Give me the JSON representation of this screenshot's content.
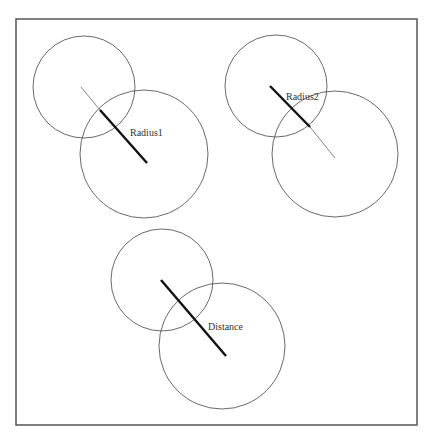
{
  "diagram": {
    "title": "",
    "colors": {
      "frame": "#555555",
      "circle": "#444444",
      "thin_line": "#666666",
      "thick_line": "#111111",
      "text": "#333333",
      "background": "#ffffff"
    },
    "frame": {
      "x": 16,
      "y": 19,
      "width": 401,
      "height": 406
    },
    "panels": [
      {
        "id": "radius1",
        "label": "Radius1",
        "label_pos": {
          "x": 130,
          "y": 136
        },
        "small_circle": {
          "cx": 84,
          "cy": 87,
          "r": 51
        },
        "large_circle": {
          "cx": 144,
          "cy": 154,
          "r": 64
        },
        "thin_segment": {
          "x1": 81,
          "y1": 87,
          "x2": 100,
          "y2": 110
        },
        "thick_segment": {
          "x1": 100,
          "y1": 110,
          "x2": 147,
          "y2": 163
        }
      },
      {
        "id": "radius2",
        "label": "Radius2",
        "label_pos": {
          "x": 286,
          "y": 100
        },
        "small_circle": {
          "cx": 276,
          "cy": 86,
          "r": 51
        },
        "large_circle": {
          "cx": 335,
          "cy": 154,
          "r": 63
        },
        "thick_segment": {
          "x1": 270,
          "y1": 86,
          "x2": 310,
          "y2": 127
        },
        "thin_segment": {
          "x1": 310,
          "y1": 127,
          "x2": 335,
          "y2": 158
        }
      },
      {
        "id": "distance",
        "label": "Distance",
        "label_pos": {
          "x": 208,
          "y": 330
        },
        "small_circle": {
          "cx": 162,
          "cy": 280,
          "r": 51
        },
        "large_circle": {
          "cx": 222,
          "cy": 346,
          "r": 63
        },
        "thick_segment": {
          "x1": 161,
          "y1": 280,
          "x2": 226,
          "y2": 356
        }
      }
    ]
  }
}
